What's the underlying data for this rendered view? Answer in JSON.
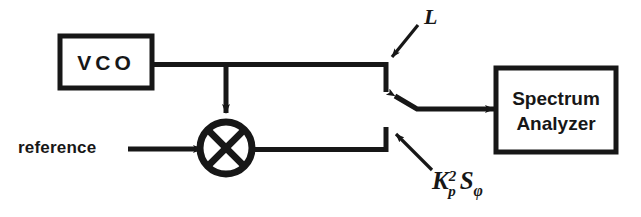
{
  "diagram": {
    "background_color": "#ffffff",
    "line_color": "#171717",
    "blocks": [
      {
        "id": "vco",
        "label": "VCO",
        "x": 60,
        "y": 36,
        "w": 92,
        "h": 52
      },
      {
        "id": "spectrum_analyzer",
        "label_line1": "Spectrum",
        "label_line2": "Analyzer",
        "x": 496,
        "y": 68,
        "w": 120,
        "h": 84
      }
    ],
    "mixer": {
      "id": "mixer",
      "symbol": "circle-x",
      "cx": 226,
      "cy": 148,
      "r": 26
    },
    "signals": [
      {
        "id": "reference",
        "label": "reference"
      },
      {
        "id": "switch_upper",
        "label": "L"
      }
    ],
    "labels": {
      "reference": "reference",
      "upper_branch": "L",
      "lower_branch_base": "K",
      "lower_branch_sub": "p",
      "lower_branch_sup": "2",
      "lower_branch_second": "S",
      "lower_branch_second_sub": "φ",
      "lower_branch_full": "Kp2 Sφ"
    }
  }
}
